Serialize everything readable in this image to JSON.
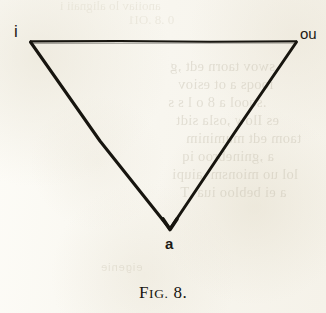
{
  "figure": {
    "caption": {
      "lead": "F",
      "smallcaps": "IG.",
      "number": "8."
    },
    "caption_full": "FIG. 8.",
    "shape": "inverted-triangle",
    "stroke_color": "#17150f",
    "vertices": [
      {
        "id": "i",
        "label": "i",
        "position": "top-left",
        "x": 30,
        "y": 42
      },
      {
        "id": "ou",
        "label": "ou",
        "position": "top-right",
        "x": 297,
        "y": 42
      },
      {
        "id": "a",
        "label": "a",
        "position": "bottom-apex",
        "x": 170,
        "y": 228
      }
    ]
  },
  "page": {
    "background_color": "#faf9f4",
    "ink_color": "#17150f",
    "ghost_color": "#b9b2a0"
  },
  "ghost_text": {
    "note": "faint show-through of text printed on the reverse of the leaf; appears mirrored and illegible",
    "top_lines": [
      "anoiiav lo alignaii i",
      "0 .8 .OI1"
    ],
    "right_lines": [
      "swov taorn edt ,g",
      "iooqs a ot esiov",
      ".sqool a 8 o l s s",
      "es Ilow ,osla sidt",
      "taom edt muminim",
      "a ,gninebroo iq",
      "lol uo mionsm ,aiupi",
      "a ei bebloo iua ,T"
    ],
    "footer_line": "eigenie"
  }
}
